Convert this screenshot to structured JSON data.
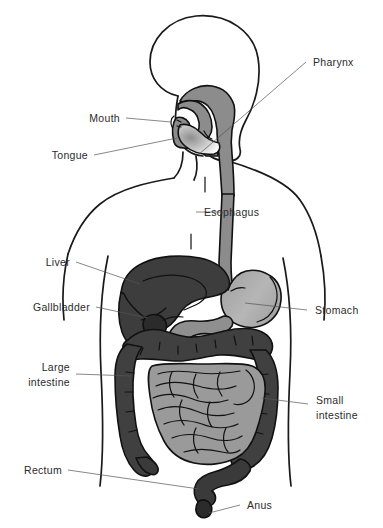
{
  "figure": {
    "background_color": "#ffffff",
    "line_color": "#1a1a1a",
    "leader_color": "#555555",
    "text_color": "#2b2b2b"
  },
  "labels": {
    "pharynx": "Pharynx",
    "mouth": "Mouth",
    "tongue": "Tongue",
    "esophagus": "Esophagus",
    "liver": "Liver",
    "gallbladder": "Gallbladder",
    "stomach": "Stomach",
    "large_intestine_line1": "Large",
    "large_intestine_line2": "intestine",
    "small_intestine_line1": "Small",
    "small_intestine_line2": "intestine",
    "rectum": "Rectum",
    "anus": "Anus"
  },
  "organs": [
    {
      "name": "pharynx",
      "label": "Pharynx",
      "color": "#8c8c8c"
    },
    {
      "name": "mouth",
      "label": "Mouth",
      "color": "#8c8c8c"
    },
    {
      "name": "tongue",
      "label": "Tongue",
      "color": "#9e9e9e"
    },
    {
      "name": "esophagus",
      "label": "Esophagus",
      "color": "#8c8c8c"
    },
    {
      "name": "liver",
      "label": "Liver",
      "color": "#3d3d3d"
    },
    {
      "name": "gallbladder",
      "label": "Gallbladder",
      "color": "#2e2e2e"
    },
    {
      "name": "stomach",
      "label": "Stomach",
      "color": "#b0b0b0"
    },
    {
      "name": "duodenum",
      "label": "Duodenum",
      "color": "#8f8f8f"
    },
    {
      "name": "large-intestine",
      "label": "Large intestine",
      "color": "#404040"
    },
    {
      "name": "small-intestine",
      "label": "Small intestine",
      "color": "#9a9a9a"
    },
    {
      "name": "rectum",
      "label": "Rectum",
      "color": "#3a3a3a"
    },
    {
      "name": "anus",
      "label": "Anus",
      "color": "#2b2b2b"
    }
  ],
  "colors": {
    "liver": "#3d3d3d",
    "gallbladder": "#2e2e2e",
    "stomach": "#b0b0b0",
    "small_intestine": "#9a9a9a",
    "large_intestine": "#404040",
    "esophagus": "#8c8c8c",
    "duodenum": "#8f8f8f",
    "tongue": "#9e9e9e",
    "outline": "#1a1a1a"
  }
}
